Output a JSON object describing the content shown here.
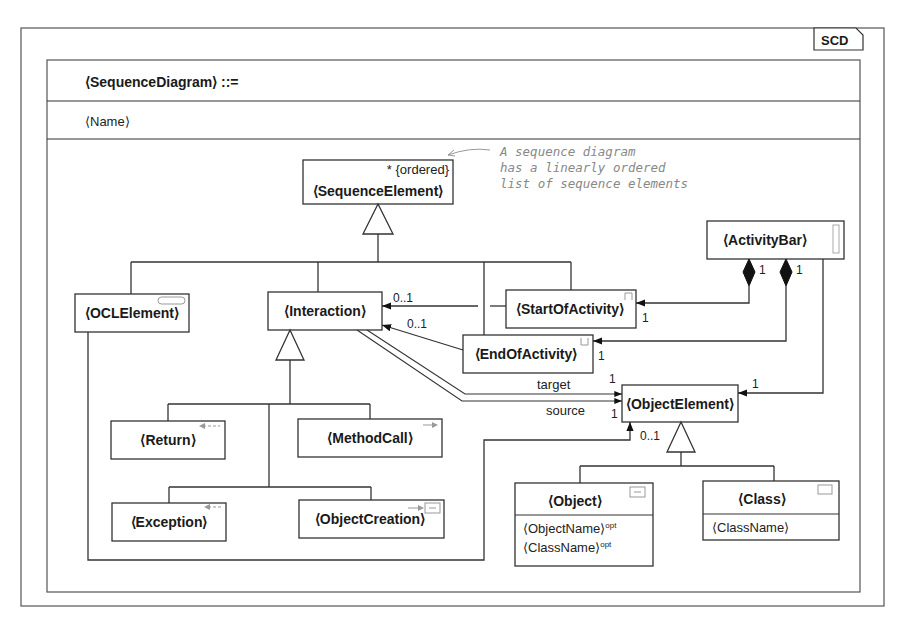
{
  "diagram": {
    "tag": "SCD",
    "header": {
      "production": "⟨SequenceDiagram⟩ ::=",
      "attribute": "⟨Name⟩"
    },
    "note": {
      "lines": [
        "A sequence diagram",
        "has a linearly ordered",
        "list of sequence elements"
      ]
    },
    "classes": {
      "sequence_element": {
        "name": "⟨SequenceElement⟩",
        "constraint": "* {ordered}"
      },
      "ocl_element": {
        "name": "⟨OCLElement⟩"
      },
      "interaction": {
        "name": "⟨Interaction⟩"
      },
      "start_of_activity": {
        "name": "⟨StartOfActivity⟩"
      },
      "end_of_activity": {
        "name": "⟨EndOfActivity⟩"
      },
      "activity_bar": {
        "name": "⟨ActivityBar⟩"
      },
      "object_element": {
        "name": "⟨ObjectElement⟩"
      },
      "return": {
        "name": "⟨Return⟩"
      },
      "method_call": {
        "name": "⟨MethodCall⟩"
      },
      "exception": {
        "name": "⟨Exception⟩"
      },
      "object_creation": {
        "name": "⟨ObjectCreation⟩"
      },
      "object": {
        "name": "⟨Object⟩",
        "attributes": [
          "⟨ObjectName⟩",
          "⟨ClassName⟩"
        ],
        "attr_suffix": "opt"
      },
      "class": {
        "name": "⟨Class⟩",
        "attributes": [
          "⟨ClassName⟩"
        ]
      }
    },
    "multiplicities": {
      "start_to_interaction": "0..1",
      "end_to_interaction": "0..1",
      "activitybar_start_src": "1",
      "activitybar_end_src": "1",
      "start_target": "1",
      "end_target": "1",
      "target_mult": "1",
      "source_mult": "1",
      "activitybar_objelem": "1",
      "ocl_objelem": "0..1"
    },
    "roles": {
      "target": "target",
      "source": "source"
    }
  }
}
